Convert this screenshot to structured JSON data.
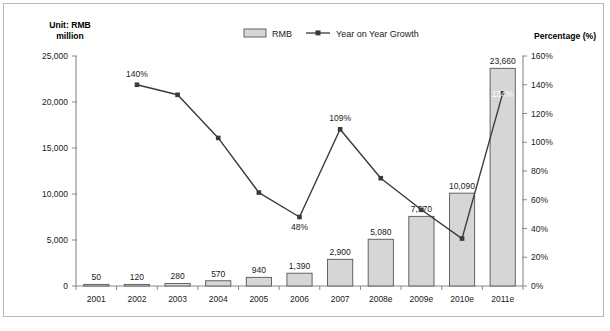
{
  "chart_data": {
    "type": "bar",
    "title": "",
    "categories": [
      "2001",
      "2002",
      "2003",
      "2004",
      "2005",
      "2006",
      "2007",
      "2008e",
      "2009e",
      "2010e",
      "2011e"
    ],
    "series": [
      {
        "name": "RMB",
        "type": "bar",
        "axis": "left",
        "values": [
          50,
          120,
          280,
          570,
          940,
          1390,
          2900,
          5080,
          7570,
          10090,
          23660
        ],
        "value_labels": [
          "50",
          "120",
          "280",
          "570",
          "940",
          "1,390",
          "2,900",
          "5,080",
          "7,570",
          "10,090",
          "23,660"
        ]
      },
      {
        "name": "Year on Year Growth",
        "type": "line",
        "axis": "right",
        "values": [
          null,
          140,
          133,
          103,
          65,
          48,
          109,
          75,
          53,
          33,
          134
        ],
        "annotations": [
          {
            "category": "2002",
            "text": "140%",
            "position": "above"
          },
          {
            "category": "2006",
            "text": "48%",
            "position": "below"
          },
          {
            "category": "2007",
            "text": "109%",
            "position": "above"
          },
          {
            "category": "2011e",
            "text": "134%",
            "position": "inside-white"
          }
        ]
      }
    ],
    "left_axis": {
      "label": "Unit: RMB million",
      "label_line1": "Unit: RMB",
      "label_line2": "million",
      "ticks": [
        0,
        5000,
        10000,
        15000,
        20000,
        25000
      ],
      "tick_labels": [
        "0",
        "5,000",
        "10,000",
        "15,000",
        "20,000",
        "25,000"
      ],
      "min": 0,
      "max": 25000
    },
    "right_axis": {
      "label": "Percentage (%)",
      "ticks": [
        0,
        20,
        40,
        60,
        80,
        100,
        120,
        140,
        160
      ],
      "tick_labels": [
        "0%",
        "20%",
        "40%",
        "60%",
        "80%",
        "100%",
        "120%",
        "140%",
        "160%"
      ],
      "min": 0,
      "max": 160
    },
    "xlabel": "",
    "grid": false,
    "legend": {
      "position": "top-center",
      "entries": [
        {
          "label": "RMB",
          "marker": "bar-swatch"
        },
        {
          "label": "Year on Year Growth",
          "marker": "line-with-point"
        }
      ]
    },
    "colors": {
      "bar_fill": "#d6d6d6",
      "bar_border": "#555555",
      "line": "#3a3a3a",
      "axis": "#8a8a8a",
      "text": "#1a1a1a",
      "frame": "#b9b9b9"
    }
  }
}
